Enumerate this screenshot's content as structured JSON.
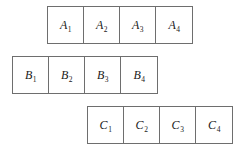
{
  "diagram": {
    "background_color": "#ffffff",
    "border_color": "#6e6e6e",
    "text_color": "#1a1a1a",
    "rows": [
      {
        "id": "row-a",
        "series_letter": "A",
        "cells": [
          {
            "letter": "A",
            "subscript": "1",
            "text": "A1"
          },
          {
            "letter": "A",
            "subscript": "2",
            "text": "A2"
          },
          {
            "letter": "A",
            "subscript": "3",
            "text": "A3"
          },
          {
            "letter": "A",
            "subscript": "4",
            "text": "A4"
          }
        ]
      },
      {
        "id": "row-b",
        "series_letter": "B",
        "cells": [
          {
            "letter": "B",
            "subscript": "1",
            "text": "B1"
          },
          {
            "letter": "B",
            "subscript": "2",
            "text": "B2"
          },
          {
            "letter": "B",
            "subscript": "3",
            "text": "B3"
          },
          {
            "letter": "B",
            "subscript": "4",
            "text": "B4"
          }
        ]
      },
      {
        "id": "row-c",
        "series_letter": "C",
        "cells": [
          {
            "letter": "C",
            "subscript": "1",
            "text": "C1"
          },
          {
            "letter": "C",
            "subscript": "2",
            "text": "C2"
          },
          {
            "letter": "C",
            "subscript": "3",
            "text": "C3"
          },
          {
            "letter": "C",
            "subscript": "4",
            "text": "C4"
          }
        ]
      }
    ]
  }
}
